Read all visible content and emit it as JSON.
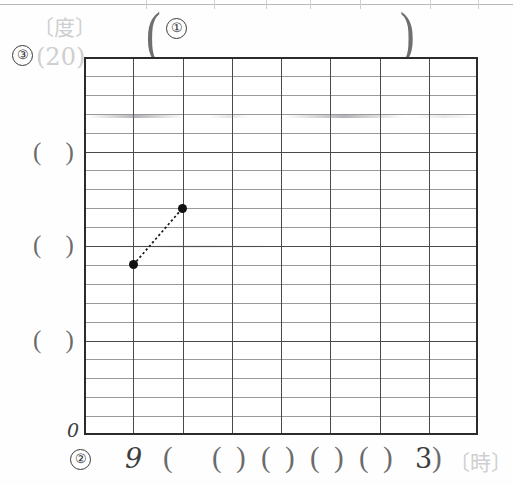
{
  "worksheet": {
    "title_row": {
      "marker": "①",
      "open_paren": "(",
      "close_paren": ")"
    },
    "y_axis": {
      "marker": "③",
      "unit_label": "〔度〕",
      "top_value": "(20)",
      "zero_label": "0",
      "blank_labels": [
        "( )",
        "( )",
        "( )"
      ],
      "max": 20,
      "min": 0,
      "minor_divisions": 20,
      "major_divisions": 4
    },
    "x_axis": {
      "marker": "②",
      "unit_label": "〔時〕",
      "start_label": "9",
      "end_label": "3",
      "blank_labels": [
        "( )",
        "( )",
        "( )",
        "( )",
        "( )"
      ],
      "columns": 8
    },
    "grid": {
      "minor_color": "#9a9a9a",
      "major_color": "#4a4a4a",
      "frame_color": "#2b2b2b"
    }
  },
  "chart_data": {
    "type": "line",
    "title": "",
    "xlabel": "〔時〕",
    "ylabel": "〔度〕",
    "xlim": [
      9,
      3
    ],
    "ylim": [
      0,
      20
    ],
    "grid": true,
    "legend": "none",
    "x_tick_labels": [
      "9",
      "( )",
      "( )",
      "( )",
      "( )",
      "( )",
      "3"
    ],
    "y_tick_labels": [
      "0",
      "( )",
      "( )",
      "( )",
      "(20)"
    ],
    "series": [
      {
        "name": "temperature",
        "style": "dotted-with-markers",
        "points": [
          {
            "x": 10,
            "y": 9
          },
          {
            "x": 11,
            "y": 12
          }
        ]
      }
    ]
  }
}
